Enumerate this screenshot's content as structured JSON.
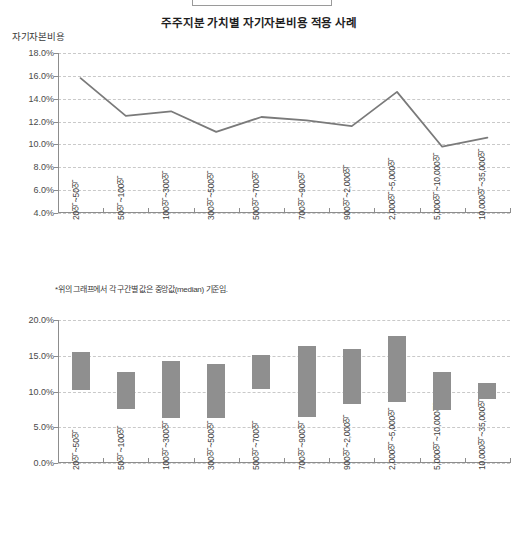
{
  "header": {
    "title": "주주지분 가치별 자기자본비용 적용 사례",
    "y_axis_name": "자기자본비용"
  },
  "footnote": "*위의 그래프에서 각 구간별 값은 중앙값(median) 기준임.",
  "colors": {
    "line": "#7a7a7a",
    "bar": "#8f8f8f",
    "grid": "#c9c9c9",
    "axis": "#8d8d8d",
    "text": "#3a3a3a"
  },
  "chart_data": [
    {
      "type": "line",
      "title": "주주지분 가치별 자기자본비용 적용 사례",
      "xlabel": "",
      "ylabel": "자기자본비용",
      "ylim": [
        4.0,
        18.0
      ],
      "ytick_step": 2.0,
      "grid": true,
      "legend": "none",
      "ytick_labels": [
        "18.0%",
        "16.0%",
        "14.0%",
        "12.0%",
        "10.0%",
        "8.0%",
        "6.0%",
        "4.0%"
      ],
      "ytick_values": [
        18.0,
        16.0,
        14.0,
        12.0,
        10.0,
        8.0,
        6.0,
        4.0
      ],
      "categories": [
        "20억~50억",
        "50억~100억",
        "100억~300억",
        "300억~500억",
        "500억~700억",
        "700억~900억",
        "900억~2,000억",
        "2,000억~5,000억",
        "5,000억~10,000억",
        "10,000억~35,000억"
      ],
      "values": [
        15.8,
        12.5,
        12.9,
        11.1,
        12.4,
        12.1,
        11.6,
        14.6,
        9.8,
        10.6
      ],
      "unit": "%"
    },
    {
      "type": "bar",
      "bar_style": "floating-range",
      "title": "",
      "xlabel": "",
      "ylabel": "",
      "ylim": [
        0.0,
        20.0
      ],
      "ytick_step": 5.0,
      "grid": true,
      "legend": "none",
      "ytick_labels": [
        "20.0%",
        "15.0%",
        "10.0%",
        "5.0%",
        "0.0%"
      ],
      "ytick_values": [
        20.0,
        15.0,
        10.0,
        5.0,
        0.0
      ],
      "categories": [
        "20억~50억",
        "50억~100억",
        "100억~300억",
        "300억~500억",
        "500억~700억",
        "700억~900억",
        "900억~2,000억",
        "2,000억~5,000억",
        "5,000억~10,000억",
        "10,000억~35,000억"
      ],
      "ranges": [
        {
          "low": 10.2,
          "high": 15.5
        },
        {
          "low": 7.6,
          "high": 12.7
        },
        {
          "low": 6.3,
          "high": 14.2
        },
        {
          "low": 6.3,
          "high": 13.8
        },
        {
          "low": 10.3,
          "high": 15.1
        },
        {
          "low": 6.4,
          "high": 16.3
        },
        {
          "low": 8.2,
          "high": 15.9
        },
        {
          "low": 8.5,
          "high": 17.7
        },
        {
          "low": 7.4,
          "high": 12.7
        },
        {
          "low": 8.9,
          "high": 11.2
        }
      ],
      "unit": "%"
    }
  ]
}
